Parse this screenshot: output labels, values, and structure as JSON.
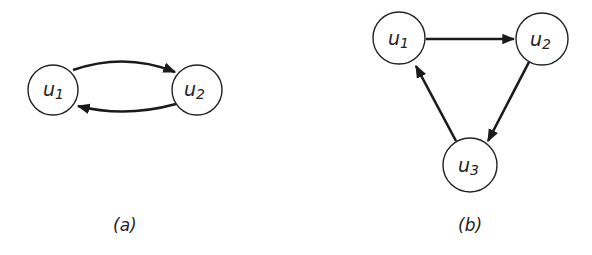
{
  "figures": [
    {
      "caption": "(a)",
      "nodes": [
        {
          "id": "u1",
          "base": "u",
          "sub": "1"
        },
        {
          "id": "u2",
          "base": "u",
          "sub": "2"
        }
      ],
      "edges": [
        {
          "from": "u1",
          "to": "u2"
        },
        {
          "from": "u2",
          "to": "u1"
        }
      ]
    },
    {
      "caption": "(b)",
      "nodes": [
        {
          "id": "u1",
          "base": "u",
          "sub": "1"
        },
        {
          "id": "u2",
          "base": "u",
          "sub": "2"
        },
        {
          "id": "u3",
          "base": "u",
          "sub": "3"
        }
      ],
      "edges": [
        {
          "from": "u1",
          "to": "u2"
        },
        {
          "from": "u2",
          "to": "u3"
        },
        {
          "from": "u3",
          "to": "u1"
        }
      ]
    }
  ],
  "colors": {
    "stroke": "#1a1a1a",
    "background": "#ffffff"
  }
}
